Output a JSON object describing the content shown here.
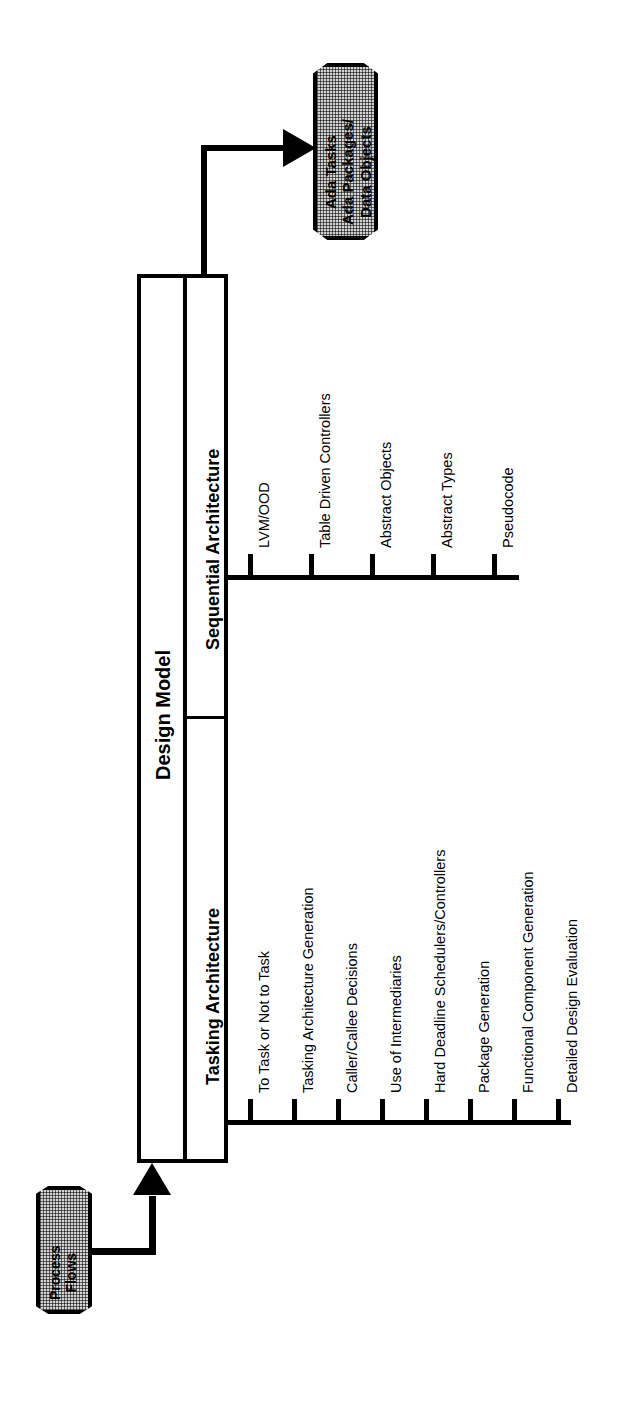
{
  "diagram": {
    "title": "Design Model",
    "main_box": {
      "label": "Design Model",
      "sections": [
        {
          "id": "sequential",
          "label": "Sequential Architecture"
        },
        {
          "id": "tasking",
          "label": "Tasking Architecture"
        }
      ]
    },
    "input": {
      "label": "Process Flows",
      "lines": [
        "Process",
        "Flows"
      ],
      "shape": "hexagon-stipple",
      "fill_color": "#d3d3d3",
      "connector": "elbow-arrow-up"
    },
    "output": {
      "label": "Ada Tasks Ada Packages/ Data Objects",
      "lines": [
        "Ada Tasks",
        "Ada Packages/",
        "Data Objects"
      ],
      "shape": "hexagon-stipple",
      "fill_color": "#d3d3d3",
      "connector": "elbow-arrow-right"
    },
    "sequential_items": [
      {
        "label": "LVM/OOD"
      },
      {
        "label": "Table Driven Controllers"
      },
      {
        "label": "Abstract Objects"
      },
      {
        "label": "Abstract Types"
      },
      {
        "label": "Pseudocode"
      }
    ],
    "tasking_items": [
      {
        "label": "To Task or Not to Task"
      },
      {
        "label": "Tasking Architecture Generation"
      },
      {
        "label": "Caller/Callee Decisions"
      },
      {
        "label": "Use of Intermediaries"
      },
      {
        "label": "Hard Deadline Schedulers/Controllers"
      },
      {
        "label": "Package Generation"
      },
      {
        "label": "Functional Component Generation"
      },
      {
        "label": "Detailed Design Evaluation"
      }
    ],
    "colors": {
      "line": "#000000",
      "background": "#ffffff",
      "shape_fill": "#d3d3d3"
    },
    "orientation": "rotated-90-ccw"
  }
}
